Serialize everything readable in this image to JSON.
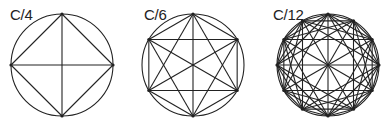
{
  "figures": [
    {
      "label": "C/4",
      "points": 4,
      "steps": [
        1,
        2
      ],
      "cx": 62,
      "cy": 65,
      "r": 51,
      "rotation_deg": -90,
      "label_x": 10
    },
    {
      "label": "C/6",
      "points": 6,
      "steps": [
        1,
        2,
        3
      ],
      "cx": 193,
      "cy": 65,
      "r": 51,
      "rotation_deg": -90,
      "label_x": 144
    },
    {
      "label": "C/12",
      "points": 12,
      "steps": [
        1,
        2,
        3,
        4,
        6
      ],
      "cx": 328,
      "cy": 65,
      "r": 51,
      "rotation_deg": -90,
      "label_x": 273
    }
  ],
  "style": {
    "stroke": "#222222",
    "stroke_width": 1.1,
    "dot_radius": 1.6
  }
}
